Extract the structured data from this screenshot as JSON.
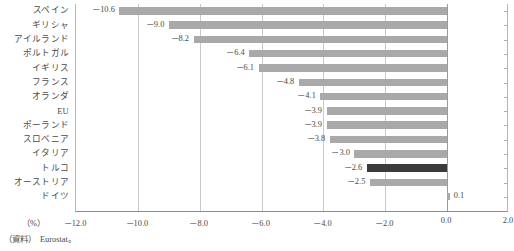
{
  "chart_data": {
    "type": "bar",
    "orientation": "horizontal",
    "title": "",
    "xlabel": "（%）",
    "ylabel": "",
    "xlim": [
      -12.0,
      2.0
    ],
    "xticks": [
      "－12.0",
      "－10.0",
      "－8.0",
      "－6.0",
      "－4.0",
      "－2.0",
      "0.0",
      "2.0"
    ],
    "xtick_values": [
      -12.0,
      -10.0,
      -8.0,
      -6.0,
      -4.0,
      -2.0,
      0.0,
      2.0
    ],
    "grid": true,
    "legend": "none",
    "categories": [
      "スペイン",
      "ギリシャ",
      "アイルランド",
      "ポルトガル",
      "イギリス",
      "フランス",
      "オランダ",
      "EU",
      "ポーランド",
      "スロベニア",
      "イタリア",
      "トルコ",
      "オーストリア",
      "ドイツ"
    ],
    "values": [
      -10.6,
      -9.0,
      -8.2,
      -6.4,
      -6.1,
      -4.8,
      -4.1,
      -3.9,
      -3.9,
      -3.8,
      -3.0,
      -2.6,
      -2.5,
      0.1
    ],
    "value_labels": [
      "－10.6",
      "－9.0",
      "－8.2",
      "－6.4",
      "－6.1",
      "－4.8",
      "－4.1",
      "－3.9",
      "－3.9",
      "－3.8",
      "－3.0",
      "－2.6",
      "－2.5",
      "0.1"
    ],
    "highlight_index": 11,
    "bar_color": "#a9a9a9",
    "highlight_color": "#3b3b3b",
    "grid_color": "#c9c9c9",
    "axis_color": "#8c8c8c"
  },
  "footer": {
    "unit": "（%）",
    "source": "（資料）　Eurostat。"
  }
}
